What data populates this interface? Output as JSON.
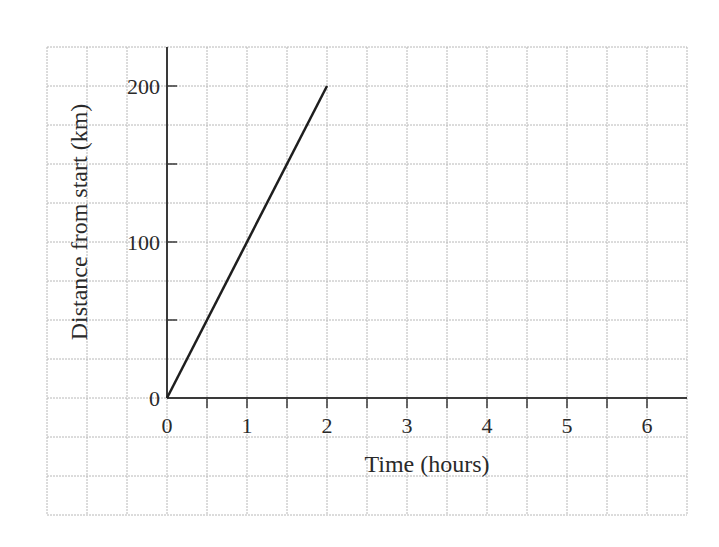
{
  "chart_data": {
    "type": "line",
    "title": "",
    "xlabel": "Time (hours)",
    "ylabel": "Distance from start (km)",
    "x_ticks": [
      "0",
      "1",
      "2",
      "3",
      "4",
      "5",
      "6"
    ],
    "y_ticks": [
      "0",
      "100",
      "200"
    ],
    "xlim": [
      0,
      6.5
    ],
    "ylim": [
      0,
      200
    ],
    "grid": true,
    "series": [
      {
        "name": "distance",
        "x": [
          0,
          2
        ],
        "y": [
          0,
          200
        ]
      }
    ]
  },
  "colors": {
    "line": "#1e1e1e",
    "axis": "#3a3a3a",
    "grid": "#b8b8b8"
  }
}
